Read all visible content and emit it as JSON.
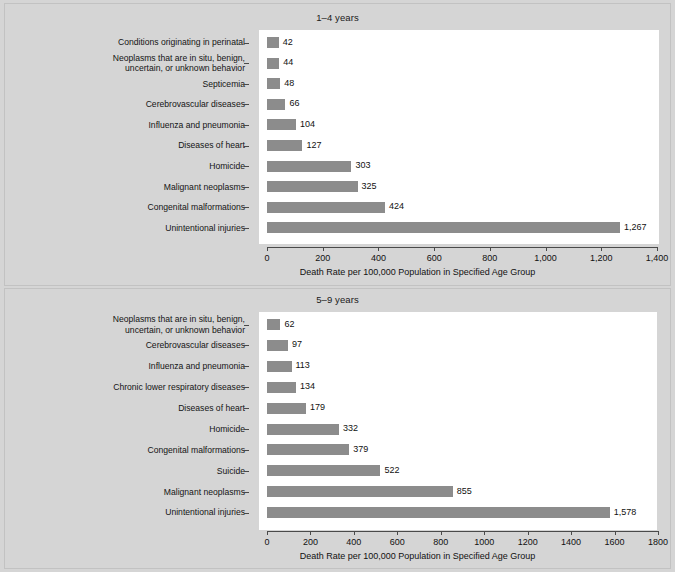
{
  "chart_data": [
    {
      "type": "bar",
      "orientation": "horizontal",
      "title": "1–4 years",
      "xlabel": "Death Rate per 100,000 Population in Specified Age Group",
      "ylabel": "",
      "xlim": [
        0,
        1400
      ],
      "xticks": [
        0,
        200,
        400,
        600,
        800,
        1000,
        1200,
        1400
      ],
      "xticklabels": [
        "0",
        "200",
        "400",
        "600",
        "800",
        "1,000",
        "1,200",
        "1,400"
      ],
      "grid": false,
      "legend": null,
      "bar_color": "#8c8c8c",
      "categories": [
        "Conditions originating in perinatal",
        "Neoplasms that are in situ, benign,\nuncertain, or unknown behavior",
        "Septicemia",
        "Cerebrovascular diseases",
        "Influenza and pneumonia",
        "Diseases of heart",
        "Homicide",
        "Malignant neoplasms",
        "Congenital malformations",
        "Unintentional injuries"
      ],
      "values": [
        42,
        44,
        48,
        66,
        104,
        127,
        303,
        325,
        424,
        1267
      ],
      "value_labels": [
        "42",
        "44",
        "48",
        "66",
        "104",
        "127",
        "303",
        "325",
        "424",
        "1,267"
      ]
    },
    {
      "type": "bar",
      "orientation": "horizontal",
      "title": "5–9 years",
      "xlabel": "Death Rate per 100,000 Population in Specified Age Group",
      "ylabel": "",
      "xlim": [
        0,
        1800
      ],
      "xticks": [
        0,
        200,
        400,
        600,
        800,
        1000,
        1200,
        1400,
        1600,
        1800
      ],
      "xticklabels": [
        "0",
        "200",
        "400",
        "600",
        "800",
        "1000",
        "1200",
        "1400",
        "1600",
        "1800"
      ],
      "grid": false,
      "legend": null,
      "bar_color": "#8c8c8c",
      "categories": [
        "Neoplasms that are in situ, benign,\nuncertain, or unknown behavior",
        "Cerebrovascular diseases",
        "Influenza and pneumonia",
        "Chronic lower respiratory diseases",
        "Diseases of heart",
        "Homicide",
        "Congenital malformations",
        "Suicide",
        "Malignant neoplasms",
        "Unintentional injuries"
      ],
      "values": [
        62,
        97,
        113,
        134,
        179,
        332,
        379,
        522,
        855,
        1578
      ],
      "value_labels": [
        "62",
        "97",
        "113",
        "134",
        "179",
        "332",
        "379",
        "522",
        "855",
        "1,578"
      ]
    }
  ]
}
